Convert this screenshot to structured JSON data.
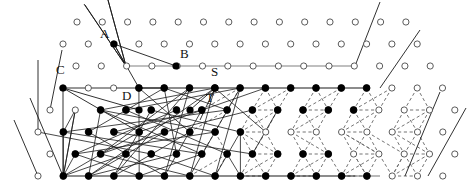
{
  "figure": {
    "name": "lattice-graph-diagram",
    "width": 475,
    "height": 193,
    "background": "#ffffff",
    "colors": {
      "node_fill": "#000000",
      "node_hollow_fill": "#ffffff",
      "node_stroke": "#4a4a4a",
      "edge_solid": "#1a1a1a",
      "edge_gray": "#808080",
      "edge_dashed": "#6b6b6b",
      "label_text": "#111111"
    },
    "lattice": {
      "type": "triangular",
      "x_spacing": 25.3,
      "y_spacing": 22,
      "row_offset": 12.6,
      "node_radius_hollow": 3.1,
      "node_radius_filled": 3.4
    }
  },
  "labels": [
    {
      "id": "A",
      "text": "A",
      "x": 100,
      "y": 34
    },
    {
      "id": "B",
      "text": "B",
      "x": 180,
      "y": 54
    },
    {
      "id": "C",
      "text": "C",
      "x": 56,
      "y": 70
    },
    {
      "id": "D",
      "text": "D",
      "x": 122,
      "y": 96
    },
    {
      "id": "S",
      "text": "S",
      "x": 211,
      "y": 72
    },
    {
      "id": "T",
      "text": "T",
      "x": 206,
      "y": 98
    }
  ],
  "chart_data": {
    "type": "scatter",
    "title": "",
    "xlabel": "",
    "ylabel": "",
    "rows": [
      {
        "row": 0,
        "y": 22,
        "x_start": 77,
        "count": 14,
        "filled_from": null
      },
      {
        "row": 1,
        "y": 44,
        "x_start": 63,
        "count": 15,
        "filled_from": null
      },
      {
        "row": 2,
        "y": 66,
        "x_start": 76,
        "count": 15,
        "filled_from": null
      },
      {
        "row": 3,
        "y": 88,
        "x_start": 63,
        "count": 16,
        "filled_from": 139
      },
      {
        "row": 4,
        "y": 110,
        "x_start": 50,
        "count": 17,
        "filled_from": 88
      },
      {
        "row": 5,
        "y": 132,
        "x_start": 38,
        "count": 17,
        "filled_from": 63
      },
      {
        "row": 6,
        "y": 154,
        "x_start": 50,
        "count": 17,
        "filled_from": 63
      },
      {
        "row": 7,
        "y": 176,
        "x_start": 38,
        "count": 17,
        "filled_from": 63
      }
    ],
    "counts": {
      "filled_nodes": 84,
      "hollow_nodes": 84,
      "solid_edges": 72,
      "dashed_edges": 96
    }
  }
}
